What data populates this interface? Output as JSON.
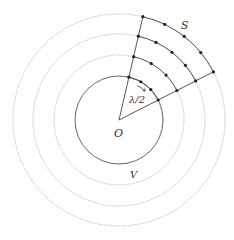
{
  "diagram": {
    "center": {
      "x": 119,
      "y": 120
    },
    "inner_circle": {
      "r": 44,
      "style": "solid",
      "color": "#555555"
    },
    "dotted_circles": [
      {
        "r": 65,
        "color": "#9a9a9a"
      },
      {
        "r": 86,
        "color": "#9a9a9a"
      },
      {
        "r": 106,
        "color": "#9a9a9a"
      }
    ],
    "sector": {
      "start_deg": 77,
      "end_deg": 27
    },
    "solid_arcs": [
      44,
      65,
      86,
      106
    ],
    "points_per_arc": [
      4,
      4,
      5,
      5
    ],
    "labels": {
      "center": "O",
      "inner": "V",
      "outer": "S",
      "wavelength": "λ/2"
    },
    "colors": {
      "line": "#444444",
      "point": "#222222"
    }
  }
}
